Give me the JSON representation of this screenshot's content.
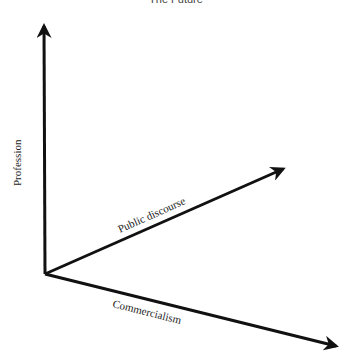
{
  "diagram": {
    "title": "The Future",
    "axes": [
      {
        "id": "profession",
        "label": "Profession",
        "from": [
          45,
          274
        ],
        "to": [
          44,
          22
        ]
      },
      {
        "id": "public-discourse",
        "label": "Public discourse",
        "from": [
          45,
          274
        ],
        "to": [
          287,
          167
        ]
      },
      {
        "id": "commercialism",
        "label": "Commercialism",
        "from": [
          45,
          274
        ],
        "to": [
          340,
          347
        ]
      }
    ]
  }
}
